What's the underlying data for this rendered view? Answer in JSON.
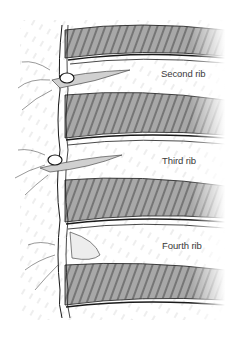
{
  "figure": {
    "labels": [
      {
        "id": "second-rib",
        "text": "Second rib",
        "x": 161,
        "y": 68
      },
      {
        "id": "third-rib",
        "text": "Third rib",
        "x": 162,
        "y": 155
      },
      {
        "id": "fourth-rib",
        "text": "Fourth rib",
        "x": 162,
        "y": 240
      }
    ],
    "colors": {
      "background": "#ffffff",
      "muscle_fill": "#a8a8a8",
      "outline": "#1a1a1a",
      "hatch": "#c8c8c8",
      "label": "#3a3a3a"
    }
  }
}
